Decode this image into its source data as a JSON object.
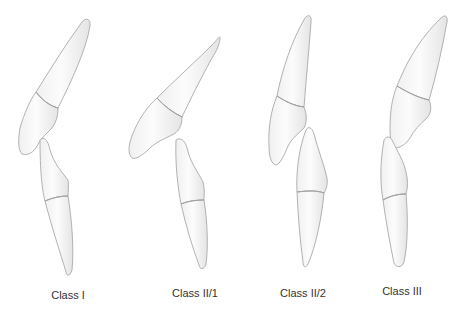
{
  "figure": {
    "type": "diagram",
    "panels": [
      {
        "id": "class-1",
        "label": "Class I"
      },
      {
        "id": "class-2-1",
        "label": "Class II/1"
      },
      {
        "id": "class-2-2",
        "label": "Class II/2"
      },
      {
        "id": "class-3",
        "label": "Class III"
      }
    ],
    "colors": {
      "background": "#ffffff",
      "tooth_fill_light": "#fbfbfb",
      "tooth_fill_shade": "#e6e6e6",
      "outline": "#a9a9a9",
      "label_text": "#333333"
    }
  }
}
